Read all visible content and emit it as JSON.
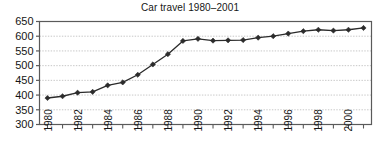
{
  "chart_data": {
    "type": "line",
    "title": "Car travel 1980–2001",
    "xlabel": "",
    "ylabel": "",
    "x": [
      1980,
      1981,
      1982,
      1983,
      1984,
      1985,
      1986,
      1987,
      1988,
      1989,
      1990,
      1991,
      1992,
      1993,
      1994,
      1995,
      1996,
      1997,
      1998,
      1999,
      2000,
      2001
    ],
    "values": [
      390,
      396,
      408,
      411,
      433,
      443,
      469,
      504,
      539,
      584,
      591,
      585,
      586,
      587,
      595,
      600,
      609,
      617,
      622,
      619,
      622,
      628
    ],
    "series": [
      {
        "name": "Car travel",
        "values": [
          390,
          396,
          408,
          411,
          433,
          443,
          469,
          504,
          539,
          584,
          591,
          585,
          586,
          587,
          595,
          600,
          609,
          617,
          622,
          619,
          622,
          628
        ]
      }
    ],
    "ylim": [
      300,
      650
    ],
    "ytick_values": [
      300,
      350,
      400,
      450,
      500,
      550,
      600,
      650
    ],
    "ytick_labels": [
      "300",
      "350",
      "400",
      "450",
      "500",
      "550",
      "600",
      "650"
    ],
    "xtick_labels": [
      "1980",
      "1982",
      "1984",
      "1986",
      "1988",
      "1990",
      "1992",
      "1994",
      "1996",
      "1998",
      "2000"
    ],
    "xtick_values": [
      1980,
      1982,
      1984,
      1986,
      1988,
      1990,
      1992,
      1994,
      1996,
      1998,
      2000
    ],
    "xtick_label_rotation": -90,
    "grid": true,
    "grid_axis": "y",
    "legend": false,
    "legend_position": "none",
    "line_color": "#2b2b2b",
    "marker": "diamond",
    "marker_color": "#2b2b2b",
    "grid_color": "#b9b9b9",
    "axis_color": "#5a5a5a",
    "background": "#ffffff"
  }
}
